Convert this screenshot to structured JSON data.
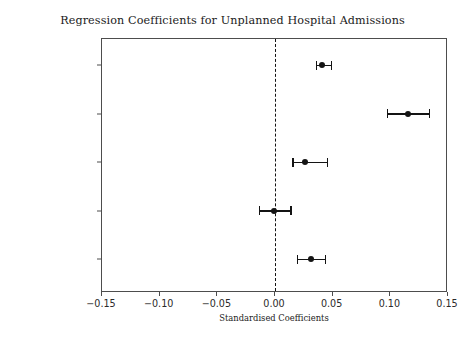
{
  "chart_data": {
    "type": "scatter",
    "title": "Regression Coefficients for Unplanned Hospital Admissions",
    "xlabel": "Standardised Coefficients",
    "ylabel": "",
    "xlim": [
      -0.15,
      0.15
    ],
    "xticks": [
      -0.15,
      -0.1,
      -0.05,
      0.0,
      0.05,
      0.1,
      0.15
    ],
    "xticklabels": [
      "−0.15",
      "−0.10",
      "−0.05",
      "0.00",
      "0.05",
      "0.10",
      "0.15"
    ],
    "grid": false,
    "legend": "none",
    "orientation": "horizontal",
    "reference_line": {
      "value": 0.0,
      "style": "dashed",
      "color": "#111111"
    },
    "marker_color": "#141414",
    "errorbar_color": "#141414",
    "categories": [
      "Age",
      "Smoker",
      "Ex Smoker",
      "Female",
      "Used Telehealth"
    ],
    "values": [
      0.042,
      0.116,
      0.027,
      0.0,
      0.032
    ],
    "ci_low": [
      0.036,
      0.098,
      0.016,
      -0.013,
      0.02
    ],
    "ci_high": [
      0.049,
      0.134,
      0.046,
      0.014,
      0.044
    ],
    "points": [
      {
        "label": "Age",
        "value": 0.042,
        "ci_low": 0.036,
        "ci_high": 0.049
      },
      {
        "label": "Smoker",
        "value": 0.116,
        "ci_low": 0.098,
        "ci_high": 0.134
      },
      {
        "label": "Ex Smoker",
        "value": 0.027,
        "ci_low": 0.016,
        "ci_high": 0.046
      },
      {
        "label": "Female",
        "value": 0.0,
        "ci_low": -0.013,
        "ci_high": 0.014
      },
      {
        "label": "Used Telehealth",
        "value": 0.032,
        "ci_low": 0.02,
        "ci_high": 0.044
      }
    ]
  }
}
